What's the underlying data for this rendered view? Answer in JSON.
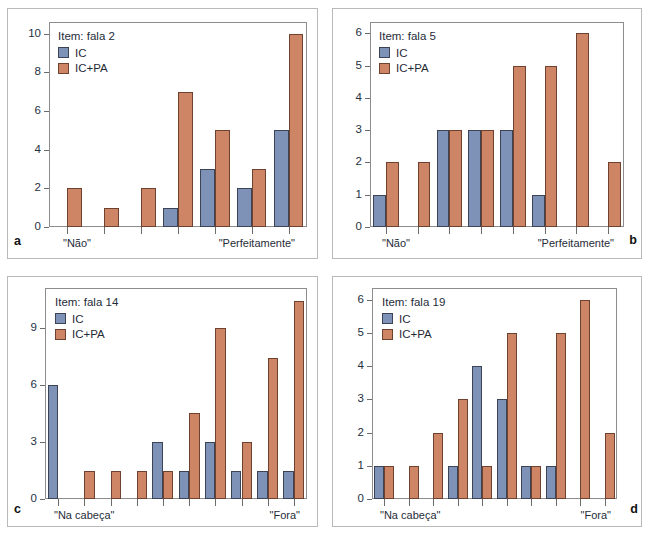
{
  "figure": {
    "background": "#ffffff",
    "series_colors": {
      "ic": "#7e92b8",
      "ic_pa": "#cd8565"
    },
    "legend_series": [
      {
        "key": "ic",
        "label": "IC",
        "color": "#7e92b8"
      },
      {
        "key": "ic_pa",
        "label": "IC+PA",
        "color": "#cd8565"
      }
    ]
  },
  "panels": [
    {
      "letter": "a",
      "legend_title": "Item: fala 2",
      "series_labels": {
        "ic": "IC",
        "ic_pa": "IC+PA"
      },
      "x_left_label": "\"Não\"",
      "x_right_label": "\"Perfeitamente\"",
      "y_ticks": [
        0,
        2,
        4,
        6,
        8,
        10
      ]
    },
    {
      "letter": "b",
      "legend_title": "Item: fala 5",
      "series_labels": {
        "ic": "IC",
        "ic_pa": "IC+PA"
      },
      "x_left_label": "\"Não\"",
      "x_right_label": "\"Perfeitamente\"",
      "y_ticks": [
        0,
        1,
        2,
        3,
        4,
        5,
        6
      ]
    },
    {
      "letter": "c",
      "legend_title": "Item: fala 14",
      "series_labels": {
        "ic": "IC",
        "ic_pa": "IC+PA"
      },
      "x_left_label": "\"Na cabeça\"",
      "x_right_label": "\"Fora\"",
      "y_ticks": [
        0,
        3,
        6,
        9
      ]
    },
    {
      "letter": "d",
      "legend_title": "Item: fala 19",
      "series_labels": {
        "ic": "IC",
        "ic_pa": "IC+PA"
      },
      "x_left_label": "\"Na cabeça\"",
      "x_right_label": "\"Fora\"",
      "y_ticks": [
        0,
        1,
        2,
        3,
        4,
        5,
        6
      ]
    }
  ],
  "chart_data": [
    {
      "type": "bar",
      "panel": "a",
      "title": "Item: fala 2",
      "xlabel": "",
      "ylabel": "",
      "categories": [
        "1",
        "2",
        "3",
        "4",
        "5",
        "6",
        "7"
      ],
      "tick_labels": [
        "\"Não\"",
        "",
        "",
        "",
        "",
        "",
        "\"Perfeitamente\""
      ],
      "series": [
        {
          "name": "IC",
          "color": "#7e92b8",
          "values": [
            0,
            0,
            0,
            1,
            3,
            2,
            5
          ]
        },
        {
          "name": "IC+PA",
          "color": "#cd8565",
          "values": [
            2,
            1,
            2,
            7,
            5,
            3,
            10
          ]
        }
      ],
      "ylim": [
        0,
        10.6
      ],
      "yticks": [
        0,
        2,
        4,
        6,
        8,
        10
      ],
      "grid": false,
      "legend_position": "top-left"
    },
    {
      "type": "bar",
      "panel": "b",
      "title": "Item: fala 5",
      "xlabel": "",
      "ylabel": "",
      "categories": [
        "1",
        "2",
        "3",
        "4",
        "5",
        "6",
        "7",
        "8"
      ],
      "tick_labels": [
        "\"Não\"",
        "",
        "",
        "",
        "",
        "",
        "",
        "\"Perfeitamente\""
      ],
      "series": [
        {
          "name": "IC",
          "color": "#7e92b8",
          "values": [
            1,
            0,
            3,
            3,
            3,
            1,
            0,
            0
          ]
        },
        {
          "name": "IC+PA",
          "color": "#cd8565",
          "values": [
            2,
            2,
            3,
            3,
            5,
            5,
            6,
            2
          ]
        }
      ],
      "ylim": [
        0,
        6.35
      ],
      "yticks": [
        0,
        1,
        2,
        3,
        4,
        5,
        6
      ],
      "grid": false,
      "legend_position": "top-left"
    },
    {
      "type": "bar",
      "panel": "c",
      "title": "Item: fala 14",
      "xlabel": "",
      "ylabel": "",
      "categories": [
        "1",
        "2",
        "3",
        "4",
        "5",
        "6",
        "7",
        "8",
        "9",
        "10"
      ],
      "tick_labels": [
        "\"Na cabeça\"",
        "",
        "",
        "",
        "",
        "",
        "",
        "",
        "",
        "\"Fora\""
      ],
      "series": [
        {
          "name": "IC",
          "color": "#7e92b8",
          "values": [
            6,
            0,
            0,
            0,
            3,
            1.5,
            3,
            1.5,
            1.5,
            1.5
          ]
        },
        {
          "name": "IC+PA",
          "color": "#cd8565",
          "values": [
            0,
            1.5,
            1.5,
            1.5,
            1.5,
            4.5,
            9,
            3,
            7.4,
            10.4
          ]
        }
      ],
      "ylim": [
        0,
        11.1
      ],
      "yticks": [
        0,
        3,
        6,
        9
      ],
      "grid": false,
      "legend_position": "top-left"
    },
    {
      "type": "bar",
      "panel": "d",
      "title": "Item: fala 19",
      "xlabel": "",
      "ylabel": "",
      "categories": [
        "1",
        "2",
        "3",
        "4",
        "5",
        "6",
        "7",
        "8",
        "9",
        "10"
      ],
      "tick_labels": [
        "\"Na cabeça\"",
        "",
        "",
        "",
        "",
        "",
        "",
        "",
        "",
        "\"Fora\""
      ],
      "series": [
        {
          "name": "IC",
          "color": "#7e92b8",
          "values": [
            1,
            0,
            0,
            1,
            4,
            3,
            1,
            1,
            0,
            0
          ]
        },
        {
          "name": "IC+PA",
          "color": "#cd8565",
          "values": [
            1,
            1,
            2,
            3,
            1,
            5,
            1,
            5,
            6,
            2
          ]
        }
      ],
      "ylim": [
        0,
        6.35
      ],
      "yticks": [
        0,
        1,
        2,
        3,
        4,
        5,
        6
      ],
      "grid": false,
      "legend_position": "top-left"
    }
  ]
}
